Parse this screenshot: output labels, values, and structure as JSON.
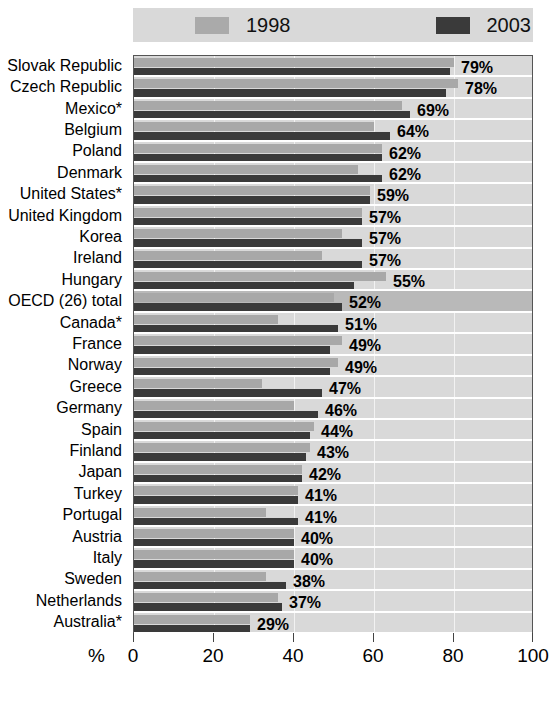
{
  "legend": {
    "entries": [
      {
        "label": "1998",
        "color": "#aaaaaa",
        "icon": "legend-swatch-1998"
      },
      {
        "label": "2003",
        "color": "#3a3a3a",
        "icon": "legend-swatch-2003"
      }
    ]
  },
  "axis": {
    "unit_label": "%",
    "ticks": [
      "0",
      "20",
      "40",
      "60",
      "80",
      "100"
    ]
  },
  "chart_data": {
    "type": "bar",
    "orientation": "horizontal",
    "title": "",
    "xlabel": "%",
    "ylabel": "",
    "xlim": [
      0,
      100
    ],
    "grid": true,
    "legend_position": "top",
    "categories": [
      "Slovak Republic",
      "Czech Republic",
      "Mexico*",
      "Belgium",
      "Poland",
      "Denmark",
      "United States*",
      "United Kingdom",
      "Korea",
      "Ireland",
      "Hungary",
      "OECD (26) total",
      "Canada*",
      "France",
      "Norway",
      "Greece",
      "Germany",
      "Spain",
      "Finland",
      "Japan",
      "Turkey",
      "Portugal",
      "Austria",
      "Italy",
      "Sweden",
      "Netherlands",
      "Australia*"
    ],
    "highlighted_category": "OECD (26) total",
    "series": [
      {
        "name": "1998",
        "color": "#a8a8a8",
        "values": [
          80,
          81,
          67,
          60,
          62,
          56,
          59,
          57,
          52,
          47,
          63,
          50,
          36,
          52,
          51,
          32,
          40,
          45,
          44,
          42,
          41,
          33,
          40,
          40,
          33,
          36,
          29
        ]
      },
      {
        "name": "2003",
        "color": "#3a3a3a",
        "values": [
          79,
          78,
          69,
          64,
          62,
          62,
          59,
          57,
          57,
          57,
          55,
          52,
          51,
          49,
          49,
          47,
          46,
          44,
          43,
          42,
          41,
          41,
          40,
          40,
          38,
          37,
          29
        ]
      }
    ],
    "value_labels": [
      "79%",
      "78%",
      "69%",
      "64%",
      "62%",
      "62%",
      "59%",
      "57%",
      "57%",
      "57%",
      "55%",
      "52%",
      "51%",
      "49%",
      "49%",
      "47%",
      "46%",
      "44%",
      "43%",
      "42%",
      "41%",
      "41%",
      "40%",
      "40%",
      "38%",
      "37%",
      "29%"
    ]
  }
}
